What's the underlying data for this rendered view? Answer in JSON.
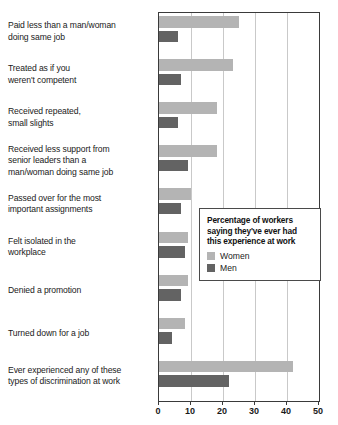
{
  "chart_data": {
    "type": "bar",
    "orientation": "horizontal",
    "title": "",
    "xlabel": "",
    "ylabel": "",
    "xlim": [
      0,
      50
    ],
    "xticks": [
      0,
      10,
      20,
      30,
      40,
      50
    ],
    "xtick_labels": [
      "0",
      "10",
      "20",
      "30",
      "40",
      "50"
    ],
    "grid": true,
    "grid_axis": "x",
    "legend_position": "inside-right",
    "categories": [
      "Paid less than a man/woman doing same job",
      "Treated as if you weren't competent",
      "Received repeated, small slights",
      "Received less support from senior leaders than a man/woman doing same job",
      "Passed over for the most important assignments",
      "Felt isolated in the workplace",
      "Denied a promotion",
      "Turned down for a job",
      "Ever experienced any of these types of discrimination at work"
    ],
    "category_lines": [
      [
        "Paid less than a man/woman",
        "doing same job"
      ],
      [
        "Treated as if you",
        "weren't competent"
      ],
      [
        "Received repeated,",
        "small slights"
      ],
      [
        "Received less support from",
        "senior leaders than a",
        "man/woman doing same job"
      ],
      [
        "Passed over for the most",
        "important assignments"
      ],
      [
        "Felt isolated in the",
        "workplace"
      ],
      [
        "Denied a promotion"
      ],
      [
        "Turned down for a job"
      ],
      [
        "Ever experienced any of these",
        "types of discrimination at work"
      ]
    ],
    "series": [
      {
        "name": "Women",
        "color": "#b4b4b4",
        "values": [
          25,
          23,
          18,
          18,
          10,
          9,
          9,
          8,
          42
        ]
      },
      {
        "name": "Men",
        "color": "#636363",
        "values": [
          6,
          7,
          6,
          9,
          7,
          8,
          7,
          4,
          22
        ]
      }
    ]
  },
  "legend": {
    "title": "Percentage of workers saying they've ever had this experience at work",
    "title_lines": [
      "Percentage of workers",
      "saying they've ever had",
      "this experience at work"
    ],
    "items": [
      {
        "label": "Women",
        "color": "#b4b4b4"
      },
      {
        "label": "Men",
        "color": "#636363"
      }
    ]
  },
  "colors": {
    "women": "#b4b4b4",
    "men": "#636363",
    "axis": "#3a3a3a",
    "grid": "#c9c9c9",
    "text": "#1a1a1a",
    "background": "#ffffff"
  }
}
